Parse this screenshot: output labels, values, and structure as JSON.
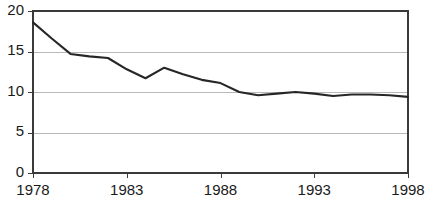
{
  "chart_data": {
    "type": "line",
    "title": "",
    "subtitle": "",
    "xlabel": "",
    "ylabel": "",
    "xlim": [
      1978,
      1998
    ],
    "ylim": [
      0,
      20
    ],
    "grid": true,
    "legend": "none",
    "yticks": [
      0,
      5,
      10,
      15,
      20
    ],
    "ytick_labels": [
      "0",
      "5",
      "10",
      "15",
      "20"
    ],
    "xticks": [
      1978,
      1983,
      1988,
      1993,
      1998
    ],
    "xtick_labels": [
      "1978",
      "1983",
      "1988",
      "1993",
      "1998"
    ],
    "x": [
      1978,
      1979,
      1980,
      1981,
      1982,
      1983,
      1984,
      1985,
      1986,
      1987,
      1988,
      1989,
      1990,
      1991,
      1992,
      1993,
      1994,
      1995,
      1996,
      1997,
      1998
    ],
    "series": [
      {
        "name": "rate",
        "color": "#262626",
        "values": [
          18.6,
          16.6,
          14.7,
          14.4,
          14.2,
          12.8,
          11.7,
          13.0,
          12.2,
          11.5,
          11.1,
          10.0,
          9.6,
          9.8,
          10.0,
          9.8,
          9.5,
          9.7,
          9.7,
          9.6,
          9.4
        ]
      }
    ]
  },
  "axes": {
    "gridline_color": "#b8b8b8",
    "frame_color": "#3a3a3a",
    "tick_color": "#3a3a3a"
  }
}
